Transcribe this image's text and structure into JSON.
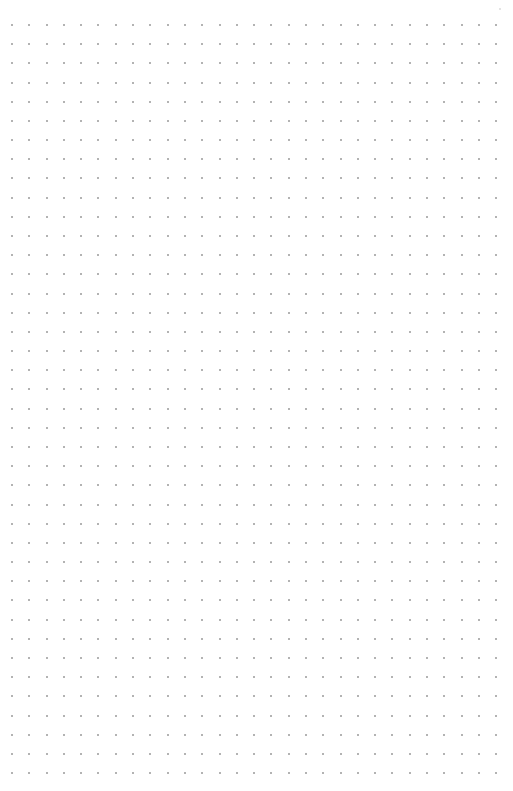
{
  "canvas": {
    "type": "dot-grid-page",
    "background_color": "#ffffff",
    "dot_color": "#9a9a9a",
    "grid": {
      "columns": 29,
      "rows": 40,
      "origin_x": 12,
      "origin_y": 25,
      "spacing_x": 17.29,
      "spacing_y": 19.18,
      "dot_size": 2
    }
  }
}
